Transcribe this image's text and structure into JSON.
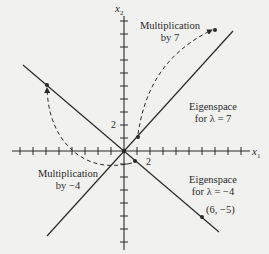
{
  "diagram": {
    "axes": {
      "x_label": "x",
      "x_sub": "1",
      "y_label": "x",
      "y_sub": "2",
      "x_tick_label": "2",
      "y_tick_label": "2"
    },
    "annotations": {
      "mult7_line1": "Multiplication",
      "mult7_line2": "by 7",
      "eig7_line1": "Eigenspace",
      "eig7_line2": "for λ = 7",
      "mult_neg4_line1": "Multiplication",
      "mult_neg4_line2": "by −4",
      "eig_neg4_line1": "Eigenspace",
      "eig_neg4_line2": "for λ = −4",
      "point_label": "(6, −5)"
    },
    "colors": {
      "background": "#f1f1ef",
      "ink": "#2a2a2a"
    }
  }
}
